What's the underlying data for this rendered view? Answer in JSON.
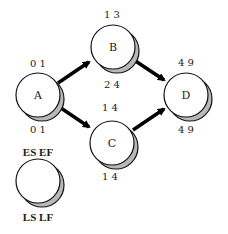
{
  "diagram": {
    "type": "network-diagram-critical-path",
    "colors": {
      "stroke": "#111111",
      "fill": "#ffffff",
      "shadow": "#b8b8b8",
      "arrow": "#000000"
    },
    "nodes": [
      {
        "id": "A",
        "label": "A",
        "top": "0 1",
        "bottom": "0 1"
      },
      {
        "id": "B",
        "label": "B",
        "top": "1 3",
        "bottom": "2 4"
      },
      {
        "id": "C",
        "label": "C",
        "top": "1 4",
        "bottom": "1 4"
      },
      {
        "id": "D",
        "label": "D",
        "top": "4 9",
        "bottom": "4 9"
      }
    ],
    "edges": [
      {
        "from": "A",
        "to": "B"
      },
      {
        "from": "A",
        "to": "C"
      },
      {
        "from": "B",
        "to": "D"
      },
      {
        "from": "C",
        "to": "D"
      }
    ],
    "legend": {
      "top": "ES EF",
      "bottom": "LS LF"
    }
  }
}
